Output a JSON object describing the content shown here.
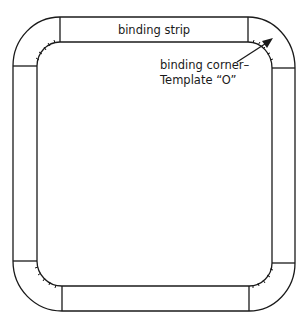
{
  "diagram": {
    "strip_label": "binding strip",
    "corner_label_line1": "binding corner–",
    "corner_label_line2": "Template “O”",
    "line_color": "#1a1a1a",
    "background_color": "#ffffff"
  }
}
